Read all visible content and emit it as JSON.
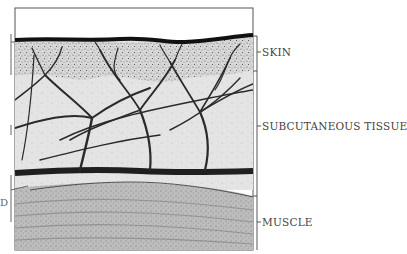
{
  "figure": {
    "type": "anatomical cross-section",
    "layers": [
      {
        "id": "skin",
        "label": "SKIN"
      },
      {
        "id": "subcutaneous",
        "label": "SUBCUTANEOUS TISSUE"
      },
      {
        "id": "muscle",
        "label": "MUSCLE"
      }
    ],
    "left_cut_label": "D"
  },
  "colors": {
    "outline": "#555555",
    "skin_surface": "#111111",
    "dermis": "#cfcfcf",
    "subcutaneous": "#e3e3e3",
    "vessel": "#2a2a2a",
    "muscle": "#b9b9b9",
    "label_text": "#444444"
  }
}
